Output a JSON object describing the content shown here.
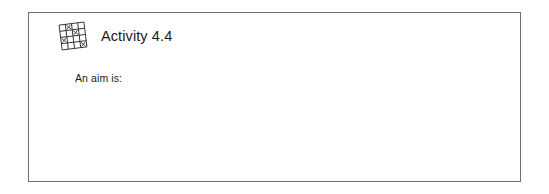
{
  "box": {
    "border_color": "#6d7073",
    "background_color": "#ffffff"
  },
  "header": {
    "icon": "grid-with-x-marks-icon",
    "title": "Activity 4.4",
    "title_color": "#1a1a1a"
  },
  "body": {
    "lines": [
      "An aim is:"
    ],
    "text_color": "#1a1a1a"
  },
  "icon_detail": {
    "name": "grid-with-x-marks-icon",
    "rows": 4,
    "columns": 4,
    "rotation_degrees": -7,
    "stroke_color": "#2b2b2b",
    "marked_cells": [
      {
        "row": 0,
        "col": 1
      },
      {
        "row": 1,
        "col": 2
      },
      {
        "row": 2,
        "col": 0
      },
      {
        "row": 3,
        "col": 3
      }
    ]
  }
}
